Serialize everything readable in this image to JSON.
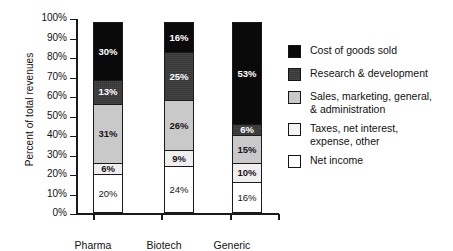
{
  "chart_data": {
    "type": "bar",
    "stacked": true,
    "stack_total": 100,
    "title": "",
    "xlabel": "",
    "ylabel": "Percent of total revenues",
    "ylim": [
      0,
      100
    ],
    "yticks": [
      "0%",
      "10%",
      "20%",
      "30%",
      "40%",
      "50%",
      "60%",
      "70%",
      "80%",
      "90%",
      "100%"
    ],
    "grid": false,
    "legend_position": "right",
    "categories": [
      "Pharma",
      "Biotech",
      "Generic"
    ],
    "series": [
      {
        "name": "Net income",
        "color": "#ffffff",
        "values": [
          20,
          24,
          16
        ],
        "labels": [
          "20%",
          "24%",
          "16%"
        ]
      },
      {
        "name": "Taxes, net interest, expense, other",
        "color": "#efefef",
        "values": [
          6,
          9,
          10
        ],
        "labels": [
          "6%",
          "9%",
          "10%"
        ]
      },
      {
        "name": "Sales, marketing, general, & administration",
        "color": "#c9c9c9",
        "values": [
          31,
          26,
          15
        ],
        "labels": [
          "31%",
          "26%",
          "15%"
        ]
      },
      {
        "name": "Research & development",
        "color": "#3b3b3b",
        "values": [
          13,
          25,
          6
        ],
        "labels": [
          "13%",
          "25%",
          "6%"
        ]
      },
      {
        "name": "Cost of goods sold",
        "color": "#0a0a0a",
        "values": [
          30,
          16,
          53
        ],
        "labels": [
          "30%",
          "16%",
          "53%"
        ]
      }
    ]
  },
  "axis": {
    "y_title": "Percent of total revenues",
    "y_ticks": [
      "100%",
      "90%",
      "80%",
      "70%",
      "60%",
      "50%",
      "40%",
      "30%",
      "20%",
      "10%",
      "0%"
    ],
    "x_categories": [
      "Pharma",
      "Biotech",
      "Generic"
    ]
  },
  "legend": {
    "items": [
      {
        "label": "Cost of goods sold",
        "label_line2": "",
        "swatch": "black"
      },
      {
        "label": "Research & development",
        "label_line2": "",
        "swatch": "dark-gray"
      },
      {
        "label": "Sales, marketing, general,",
        "label_line2": "& administration",
        "swatch": "light-gray"
      },
      {
        "label": "Taxes, net interest,",
        "label_line2": "expense, other",
        "swatch": "very-light-gray"
      },
      {
        "label": "Net income",
        "label_line2": "",
        "swatch": "white"
      }
    ]
  },
  "bars": {
    "pharma": {
      "name": "Pharma",
      "segments": [
        {
          "key": "cogs",
          "label": "30%"
        },
        {
          "key": "rnd",
          "label": "13%"
        },
        {
          "key": "smga",
          "label": "31%"
        },
        {
          "key": "tax",
          "label": "6%"
        },
        {
          "key": "net",
          "label": "20%"
        }
      ]
    },
    "biotech": {
      "name": "Biotech",
      "segments": [
        {
          "key": "cogs",
          "label": "16%"
        },
        {
          "key": "rnd",
          "label": "25%"
        },
        {
          "key": "smga",
          "label": "26%"
        },
        {
          "key": "tax",
          "label": "9%"
        },
        {
          "key": "net",
          "label": "24%"
        }
      ]
    },
    "generic": {
      "name": "Generic",
      "segments": [
        {
          "key": "cogs",
          "label": "53%"
        },
        {
          "key": "rnd",
          "label": "6%"
        },
        {
          "key": "smga",
          "label": "15%"
        },
        {
          "key": "tax",
          "label": "10%"
        },
        {
          "key": "net",
          "label": "16%"
        }
      ]
    }
  }
}
